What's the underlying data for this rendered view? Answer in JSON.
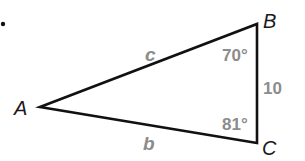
{
  "diagram": {
    "type": "triangle",
    "bullet": "•",
    "vertices": [
      {
        "label": "A",
        "x": 40,
        "y": 107
      },
      {
        "label": "B",
        "x": 257,
        "y": 24
      },
      {
        "label": "C",
        "x": 257,
        "y": 143
      }
    ],
    "sides": {
      "AB": "c",
      "AC": "b",
      "BC": "10"
    },
    "angles": {
      "B": "70°",
      "C": "81°"
    },
    "colors": {
      "line": "#111111",
      "vertex_label": "#1a1a1a",
      "annotation": "#8c8c8c"
    }
  }
}
